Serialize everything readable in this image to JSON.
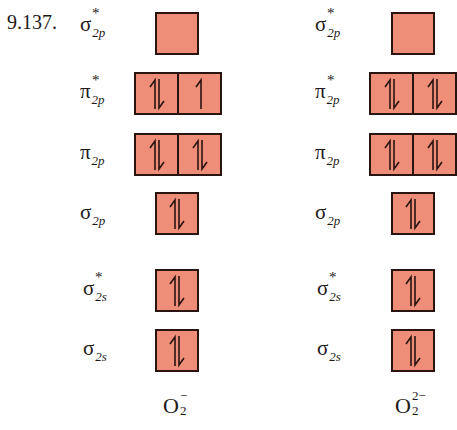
{
  "problem_number": "9.137.",
  "colors": {
    "orbital_fill": "#ee8e78",
    "orbital_border": "#2a1410"
  },
  "diagrams": [
    {
      "ion": {
        "base": "O",
        "subscript": "2",
        "superscript": "−"
      },
      "orbitals": [
        {
          "symbol": "σ",
          "sub": "2p",
          "sup": "*",
          "electrons": [
            "empty"
          ]
        },
        {
          "symbol": "π",
          "sub": "2p",
          "sup": "*",
          "electrons": [
            "paired",
            "up"
          ]
        },
        {
          "symbol": "π",
          "sub": "2p",
          "sup": "",
          "electrons": [
            "paired",
            "paired"
          ]
        },
        {
          "symbol": "σ",
          "sub": "2p",
          "sup": "",
          "electrons": [
            "paired"
          ]
        },
        {
          "symbol": "σ",
          "sub": "2s",
          "sup": "*",
          "electrons": [
            "paired"
          ]
        },
        {
          "symbol": "σ",
          "sub": "2s",
          "sup": "",
          "electrons": [
            "paired"
          ]
        }
      ]
    },
    {
      "ion": {
        "base": "O",
        "subscript": "2",
        "superscript": "2−"
      },
      "orbitals": [
        {
          "symbol": "σ",
          "sub": "2p",
          "sup": "*",
          "electrons": [
            "empty"
          ]
        },
        {
          "symbol": "π",
          "sub": "2p",
          "sup": "*",
          "electrons": [
            "paired",
            "paired"
          ]
        },
        {
          "symbol": "π",
          "sub": "2p",
          "sup": "",
          "electrons": [
            "paired",
            "paired"
          ]
        },
        {
          "symbol": "σ",
          "sub": "2p",
          "sup": "",
          "electrons": [
            "paired"
          ]
        },
        {
          "symbol": "σ",
          "sub": "2s",
          "sup": "*",
          "electrons": [
            "paired"
          ]
        },
        {
          "symbol": "σ",
          "sub": "2s",
          "sup": "",
          "electrons": [
            "paired"
          ]
        }
      ]
    }
  ]
}
